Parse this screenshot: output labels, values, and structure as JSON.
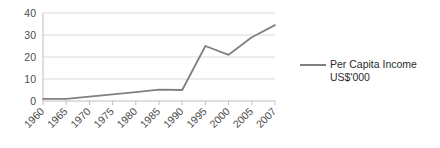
{
  "chart_data": {
    "type": "line",
    "title": "",
    "xlabel": "",
    "ylabel": "",
    "categories": [
      "1960",
      "1965",
      "1970",
      "1975",
      "1980",
      "1985",
      "1990",
      "1995",
      "2000",
      "2005",
      "2007"
    ],
    "series": [
      {
        "name": "Per Capita Income US$'000",
        "values": [
          1,
          1,
          2,
          3,
          4,
          5.2,
          5,
          25,
          21,
          29,
          34.5
        ],
        "color": "#808080"
      }
    ],
    "ylim": [
      0,
      40
    ],
    "yticks": [
      0,
      10,
      20,
      30,
      40
    ],
    "ytick_labels": [
      "0",
      "10",
      "20",
      "30",
      "40"
    ],
    "grid": true,
    "grid_color": "#d9d9d9",
    "legend_position": "right",
    "legend": {
      "line1": "Per Capita Income",
      "line2": "US$'000"
    }
  },
  "axis": {
    "y_tick_0": "0",
    "y_tick_1": "10",
    "y_tick_2": "20",
    "y_tick_3": "30",
    "y_tick_4": "40"
  }
}
